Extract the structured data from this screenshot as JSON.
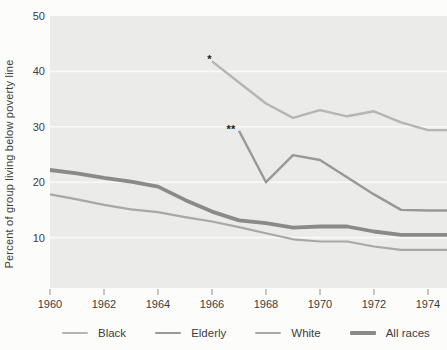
{
  "colors": {
    "page_background": "#fcfcfb",
    "panel_background": "#ebebe9",
    "gridline": "#f9f9f7",
    "tick": "#8f8f8f",
    "text": "#3c3c3c",
    "annotation": "#1b1b1b"
  },
  "chart_data": {
    "type": "line",
    "title": "",
    "xlabel": "",
    "ylabel": "Percent of group living below poverty line",
    "x_ticks": [
      1960,
      1962,
      1964,
      1966,
      1968,
      1970,
      1972,
      1974
    ],
    "y_ticks": [
      10,
      20,
      30,
      40,
      50
    ],
    "xlim": [
      1960,
      1974.7
    ],
    "ylim": [
      0,
      50
    ],
    "grid": "horizontal-white-on-gray-panel",
    "legend_position": "bottom",
    "annotations": [
      {
        "label": "*",
        "year": 1965.9,
        "value": 41.5
      },
      {
        "label": "**",
        "year": 1966.7,
        "value": 28.9
      }
    ],
    "series": [
      {
        "name": "Black",
        "color": "#b5b5b5",
        "width": 2.4,
        "x": [
          1966,
          1967,
          1968,
          1969,
          1970,
          1971,
          1972,
          1973,
          1974
        ],
        "values": [
          41.8,
          38.0,
          34.2,
          31.6,
          33.0,
          31.9,
          32.8,
          30.8,
          29.4
        ]
      },
      {
        "name": "Elderly",
        "color": "#989898",
        "width": 2.4,
        "x": [
          1967,
          1968,
          1969,
          1970,
          1971,
          1972,
          1973,
          1974
        ],
        "values": [
          29.3,
          20.0,
          24.9,
          24.0,
          20.9,
          17.8,
          15.0,
          14.9
        ]
      },
      {
        "name": "White",
        "color": "#a8a8a8",
        "width": 2.2,
        "x": [
          1960,
          1961,
          1962,
          1963,
          1964,
          1965,
          1966,
          1967,
          1968,
          1969,
          1970,
          1971,
          1972,
          1973,
          1974
        ],
        "values": [
          17.8,
          16.9,
          15.9,
          15.1,
          14.6,
          13.7,
          12.9,
          11.9,
          10.8,
          9.7,
          9.3,
          9.3,
          8.4,
          7.8,
          7.8
        ]
      },
      {
        "name": "All races",
        "color": "#8a8a8a",
        "width": 3.8,
        "x": [
          1960,
          1961,
          1962,
          1963,
          1964,
          1965,
          1966,
          1967,
          1968,
          1969,
          1970,
          1971,
          1972,
          1973,
          1974
        ],
        "values": [
          22.2,
          21.6,
          20.8,
          20.1,
          19.2,
          16.8,
          14.7,
          13.1,
          12.6,
          11.8,
          12.0,
          12.0,
          11.1,
          10.5,
          10.5
        ]
      }
    ]
  }
}
